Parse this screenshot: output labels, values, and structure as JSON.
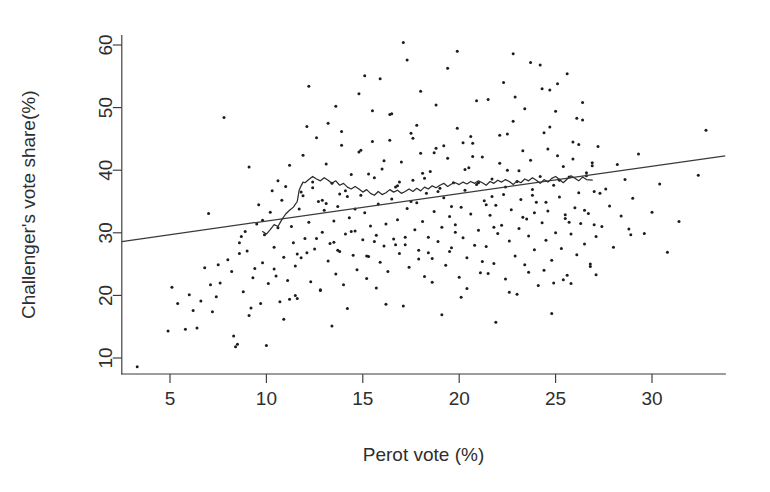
{
  "chart_data": {
    "type": "scatter",
    "title": "",
    "xlabel": "Perot vote (%)",
    "ylabel": "Challenger's vote share(%)",
    "xlim": [
      2.5,
      33.8
    ],
    "ylim": [
      7.0,
      61.5
    ],
    "grid": false,
    "legend": null,
    "xticks": [
      5,
      10,
      15,
      20,
      25,
      30
    ],
    "yticks": [
      10,
      20,
      30,
      40,
      50,
      60
    ],
    "xtick_labels": [
      "5",
      "10",
      "15",
      "20",
      "25",
      "30"
    ],
    "ytick_labels": [
      "10",
      "20",
      "30",
      "40",
      "50",
      "60"
    ],
    "point_color": "#1c1c1c",
    "line_color": "#3a3a3a",
    "smooth_color": "#2d2d2d",
    "series": [
      {
        "name": "districts",
        "marker": "dot",
        "x": [
          3.3,
          4.9,
          5.1,
          5.4,
          5.8,
          6.0,
          6.2,
          6.4,
          6.6,
          6.8,
          7.0,
          7.1,
          7.2,
          7.4,
          7.6,
          7.8,
          8.0,
          8.2,
          8.3,
          8.4,
          8.5,
          8.6,
          8.7,
          8.8,
          8.9,
          9.0,
          9.1,
          9.2,
          9.3,
          9.4,
          9.5,
          9.6,
          9.7,
          9.8,
          9.9,
          10.0,
          10.1,
          10.2,
          10.3,
          10.4,
          10.5,
          10.6,
          10.7,
          10.8,
          10.9,
          11.0,
          11.1,
          11.2,
          11.3,
          11.4,
          11.5,
          11.6,
          11.7,
          11.8,
          11.9,
          12.0,
          12.1,
          12.2,
          12.3,
          12.4,
          12.5,
          12.6,
          12.7,
          12.8,
          12.9,
          13.0,
          13.1,
          13.2,
          13.3,
          13.4,
          13.5,
          13.6,
          13.7,
          13.8,
          13.9,
          14.0,
          14.1,
          14.2,
          14.3,
          14.4,
          14.5,
          14.6,
          14.7,
          14.8,
          14.9,
          15.0,
          15.1,
          15.2,
          15.3,
          15.4,
          15.5,
          15.6,
          15.7,
          15.8,
          15.9,
          16.0,
          16.1,
          16.2,
          16.3,
          16.4,
          16.5,
          16.6,
          16.7,
          16.8,
          16.9,
          17.0,
          17.1,
          17.2,
          17.3,
          17.4,
          17.5,
          17.6,
          17.7,
          17.8,
          17.9,
          18.0,
          18.1,
          18.2,
          18.3,
          18.4,
          18.5,
          18.6,
          18.7,
          18.8,
          18.9,
          19.0,
          19.1,
          19.2,
          19.3,
          19.4,
          19.5,
          19.6,
          19.7,
          19.8,
          19.9,
          20.0,
          20.1,
          20.2,
          20.3,
          20.4,
          20.5,
          20.6,
          20.7,
          20.8,
          20.9,
          21.0,
          21.1,
          21.2,
          21.3,
          21.4,
          21.5,
          21.6,
          21.7,
          21.8,
          21.9,
          22.0,
          22.1,
          22.2,
          22.3,
          22.4,
          22.5,
          22.6,
          22.7,
          22.8,
          22.9,
          23.0,
          23.1,
          23.2,
          23.3,
          23.4,
          23.5,
          23.6,
          23.7,
          23.8,
          23.9,
          24.0,
          24.1,
          24.2,
          24.3,
          24.4,
          24.5,
          24.6,
          24.7,
          24.8,
          24.9,
          25.0,
          25.1,
          25.2,
          25.3,
          25.4,
          25.5,
          25.6,
          25.7,
          25.8,
          25.9,
          26.0,
          26.1,
          26.2,
          26.3,
          26.4,
          26.5,
          26.6,
          26.7,
          26.8,
          26.9,
          27.0,
          27.1,
          27.2,
          27.4,
          27.6,
          27.8,
          28.0,
          28.2,
          28.4,
          28.6,
          28.8,
          29.0,
          29.3,
          29.6,
          30.0,
          30.4,
          30.8,
          31.4,
          32.4,
          32.8,
          9.1,
          10.6,
          11.9,
          12.4,
          13.1,
          13.8,
          14.6,
          15.3,
          16.1,
          16.8,
          17.5,
          18.2,
          18.9,
          19.6,
          20.3,
          21.0,
          21.7,
          22.4,
          23.1,
          23.8,
          24.5,
          25.2,
          25.9,
          26.6,
          27.3,
          11.2,
          12.8,
          14.2,
          15.7,
          17.1,
          18.6,
          20.1,
          21.5,
          23.0,
          24.4,
          25.8,
          12.2,
          13.6,
          15.1,
          16.5,
          18.0,
          19.4,
          20.9,
          22.3,
          23.7,
          25.1,
          26.4,
          10.9,
          13.4,
          16.2,
          19.1,
          21.9,
          24.8,
          8.6,
          7.5,
          9.8,
          11.6,
          14.9,
          17.8,
          20.6,
          23.4,
          26.2,
          28.9,
          22.8,
          24.2,
          25.6,
          19.9,
          17.3,
          15.9,
          13.2,
          21.2,
          23.6,
          25.4,
          26.8,
          18.4,
          16.7,
          14.4,
          12.6,
          20.4,
          22.6,
          24.9,
          27.1,
          19.2,
          17.6,
          15.5,
          13.9,
          21.8,
          23.3,
          25.7,
          26.5,
          18.8,
          16.4,
          14.8,
          12.1,
          20.7,
          22.1,
          24.6,
          26.9,
          19.5,
          17.9,
          15.2,
          13.5,
          11.5,
          22.9,
          24.3,
          25.0,
          18.1,
          16.9,
          14.1,
          12.9,
          21.4,
          23.9,
          25.5,
          27.0,
          19.8,
          17.2,
          15.6,
          13.7,
          11.8,
          10.4,
          22.5,
          24.7,
          26.1,
          20.2,
          18.7
        ],
        "y": [
          8.6,
          14.3,
          21.3,
          18.7,
          14.6,
          20.1,
          17.6,
          14.8,
          19.1,
          24.4,
          33.1,
          21.7,
          17.4,
          19.8,
          22.0,
          48.4,
          25.7,
          23.8,
          13.5,
          11.8,
          12.2,
          26.7,
          29.4,
          20.6,
          30.2,
          27.1,
          16.8,
          18.0,
          22.8,
          24.3,
          31.4,
          34.5,
          18.7,
          25.2,
          29.7,
          12.0,
          21.9,
          33.3,
          36.7,
          27.7,
          23.1,
          30.8,
          19.0,
          35.2,
          26.1,
          37.4,
          22.4,
          40.8,
          31.0,
          28.4,
          24.7,
          19.5,
          33.8,
          36.5,
          42.4,
          29.1,
          26.8,
          31.7,
          22.2,
          38.1,
          27.4,
          45.2,
          35.0,
          20.9,
          30.1,
          33.6,
          41.0,
          25.5,
          28.3,
          37.9,
          31.9,
          23.4,
          34.2,
          27.0,
          44.0,
          21.7,
          29.8,
          35.8,
          32.4,
          39.3,
          26.4,
          30.3,
          24.1,
          42.9,
          36.0,
          28.9,
          33.2,
          22.7,
          26.2,
          31.1,
          49.5,
          38.8,
          29.6,
          34.6,
          25.3,
          40.2,
          27.9,
          31.4,
          23.8,
          44.8,
          35.4,
          29.0,
          37.3,
          32.1,
          26.7,
          41.3,
          60.4,
          28.1,
          33.9,
          24.5,
          45.9,
          38.4,
          30.5,
          34.8,
          27.2,
          42.7,
          31.8,
          23.0,
          36.3,
          29.3,
          39.8,
          25.9,
          33.4,
          43.5,
          28.6,
          37.1,
          30.9,
          35.6,
          24.8,
          41.9,
          32.6,
          27.6,
          38.0,
          31.3,
          46.7,
          22.9,
          34.1,
          29.2,
          36.8,
          26.0,
          40.4,
          33.0,
          44.3,
          28.0,
          37.7,
          30.4,
          23.6,
          42.1,
          35.1,
          27.8,
          51.3,
          32.8,
          38.6,
          25.1,
          34.4,
          29.9,
          45.6,
          31.2,
          36.1,
          22.6,
          40.0,
          28.7,
          33.7,
          47.8,
          26.3,
          38.2,
          30.7,
          35.3,
          43.1,
          24.9,
          32.2,
          29.5,
          41.6,
          36.9,
          27.3,
          34.9,
          21.6,
          39.0,
          31.6,
          46.0,
          28.8,
          33.5,
          52.8,
          25.6,
          37.6,
          30.0,
          42.3,
          35.7,
          27.5,
          40.6,
          32.3,
          23.2,
          38.9,
          29.8,
          44.5,
          34.0,
          26.5,
          36.4,
          31.5,
          48.0,
          28.2,
          39.6,
          33.1,
          25.0,
          41.2,
          36.6,
          29.4,
          43.8,
          31.0,
          37.0,
          34.3,
          27.7,
          40.9,
          32.7,
          38.5,
          30.6,
          35.5,
          42.6,
          29.9,
          33.3,
          37.8,
          26.9,
          31.8,
          39.2,
          46.4,
          40.5,
          38.3,
          35.9,
          37.2,
          34.7,
          36.2,
          33.8,
          39.4,
          41.5,
          37.5,
          35.0,
          38.7,
          36.6,
          34.2,
          40.1,
          38.0,
          35.8,
          37.3,
          39.9,
          36.0,
          34.9,
          38.4,
          41.8,
          39.1,
          36.3,
          19.4,
          20.8,
          17.9,
          21.2,
          18.3,
          22.1,
          19.7,
          23.5,
          20.2,
          24.0,
          21.9,
          53.4,
          50.2,
          55.1,
          49.0,
          52.6,
          56.3,
          51.1,
          54.0,
          57.2,
          53.8,
          50.8,
          16.2,
          15.1,
          18.6,
          16.9,
          15.7,
          17.1,
          28.4,
          24.9,
          32.0,
          26.6,
          43.2,
          47.2,
          45.4,
          49.8,
          44.1,
          29.7,
          58.6,
          56.8,
          55.4,
          59.0,
          57.6,
          54.6,
          47.5,
          25.4,
          23.7,
          22.5,
          24.6,
          26.8,
          28.1,
          30.2,
          29.1,
          21.1,
          20.5,
          22.0,
          23.3,
          43.9,
          45.1,
          44.6,
          46.2,
          30.9,
          32.5,
          31.7,
          33.6,
          50.4,
          48.9,
          52.2,
          47.0,
          42.2,
          41.1,
          43.4,
          40.7,
          27.0,
          25.8,
          26.3,
          28.5,
          20.0,
          51.7,
          53.0,
          49.4,
          39.5,
          38.1,
          36.7,
          35.2,
          34.5,
          33.2,
          32.9,
          31.3,
          30.1,
          29.3,
          28.6,
          27.2,
          26.0,
          24.2,
          45.8,
          46.9,
          48.3,
          44.4,
          42.8
        ]
      }
    ],
    "fit_line": {
      "name": "least-squares fit",
      "x_start": 2.5,
      "y_start": 28.6,
      "x_end": 33.8,
      "y_end": 42.3
    },
    "smooth_curve": {
      "name": "running mean",
      "x": [
        9.8,
        10.0,
        10.2,
        10.4,
        10.6,
        10.8,
        11.0,
        11.2,
        11.4,
        11.6,
        11.7,
        11.8,
        11.9,
        12.0,
        12.2,
        12.4,
        12.6,
        12.8,
        13.0,
        13.2,
        13.4,
        13.6,
        13.8,
        14.0,
        14.2,
        14.4,
        14.6,
        14.8,
        15.0,
        15.2,
        15.4,
        15.6,
        15.8,
        16.0,
        16.2,
        16.4,
        16.6,
        16.8,
        17.0,
        17.2,
        17.4,
        17.6,
        17.8,
        18.0,
        18.2,
        18.4,
        18.6,
        18.8,
        19.0,
        19.2,
        19.4,
        19.6,
        19.8,
        20.0,
        20.2,
        20.4,
        20.6,
        20.8,
        21.0,
        21.2,
        21.4,
        21.6,
        21.8,
        22.0,
        22.2,
        22.4,
        22.6,
        22.8,
        23.0,
        23.2,
        23.4,
        23.6,
        23.8,
        24.0,
        24.2,
        24.4,
        24.6,
        24.8,
        25.0,
        25.2,
        25.4,
        25.6,
        25.8,
        26.0,
        26.2,
        26.4,
        26.6,
        26.9
      ],
      "y": [
        30.2,
        29.8,
        30.5,
        31.3,
        31.0,
        32.1,
        33.0,
        33.6,
        34.1,
        35.0,
        36.8,
        37.5,
        38.1,
        38.0,
        38.5,
        39.0,
        38.6,
        38.3,
        38.8,
        38.4,
        37.9,
        38.3,
        37.6,
        37.9,
        37.3,
        37.0,
        37.4,
        37.0,
        36.5,
        36.9,
        36.3,
        36.0,
        36.6,
        36.1,
        36.4,
        36.9,
        36.5,
        36.8,
        36.3,
        36.6,
        37.0,
        36.6,
        37.1,
        36.7,
        37.3,
        37.0,
        37.5,
        37.2,
        37.6,
        37.9,
        37.4,
        37.8,
        38.0,
        37.7,
        38.1,
        37.8,
        38.2,
        37.9,
        38.3,
        38.0,
        37.6,
        38.2,
        37.9,
        38.4,
        38.1,
        38.5,
        38.2,
        37.7,
        38.3,
        38.0,
        38.6,
        38.3,
        38.8,
        38.4,
        37.9,
        38.5,
        38.1,
        38.7,
        39.0,
        38.5,
        38.0,
        38.6,
        39.1,
        38.7,
        38.3,
        38.9,
        38.5,
        38.4
      ]
    }
  }
}
